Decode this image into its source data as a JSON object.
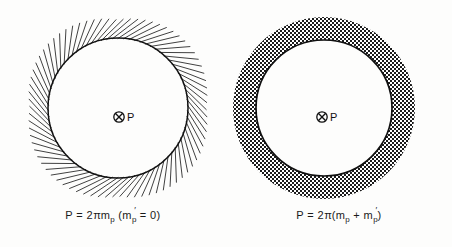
{
  "document": {
    "type": "line-drawing-figure-pair",
    "background_color": "#fdfdfc",
    "ink_color": "#1a1a1a"
  },
  "figures": [
    {
      "id": "left",
      "name": "radial-hatch-circle",
      "center_marker": {
        "icon": "circle-x-icon",
        "label": "P"
      },
      "caption": {
        "lead": "P = 2",
        "pi": "π",
        "mass": "m",
        "mass_sub": "p",
        "paren_open": "(m",
        "paren_sub": "p",
        "paren_prime": "′",
        "paren_close": " = 0)",
        "full_text": "P = 2π mₚ (m′ₚ = 0)"
      },
      "geometry": {
        "circle_center_x": 118,
        "circle_center_y": 108,
        "circle_radius": 70,
        "hatch_length": 22,
        "hatch_count": 78,
        "hatch_style": "radial-outward-slanted"
      }
    },
    {
      "id": "right",
      "name": "crosshatch-annulus-circle",
      "center_marker": {
        "icon": "circle-x-icon",
        "label": "P"
      },
      "caption": {
        "lead": "P = 2",
        "pi": "π",
        "paren_open": "(m",
        "mass_sub": "p",
        "plus": " + m",
        "mass2_sub": "p",
        "prime": "′",
        "paren_close": ")",
        "full_text": "P = 2π (mₚ + m′ₚ)"
      },
      "geometry": {
        "circle_center_x": 98,
        "circle_center_y": 108,
        "inner_radius": 68,
        "outer_radius": 91,
        "ring_fill": "checkerboard-crosshatch"
      }
    }
  ]
}
